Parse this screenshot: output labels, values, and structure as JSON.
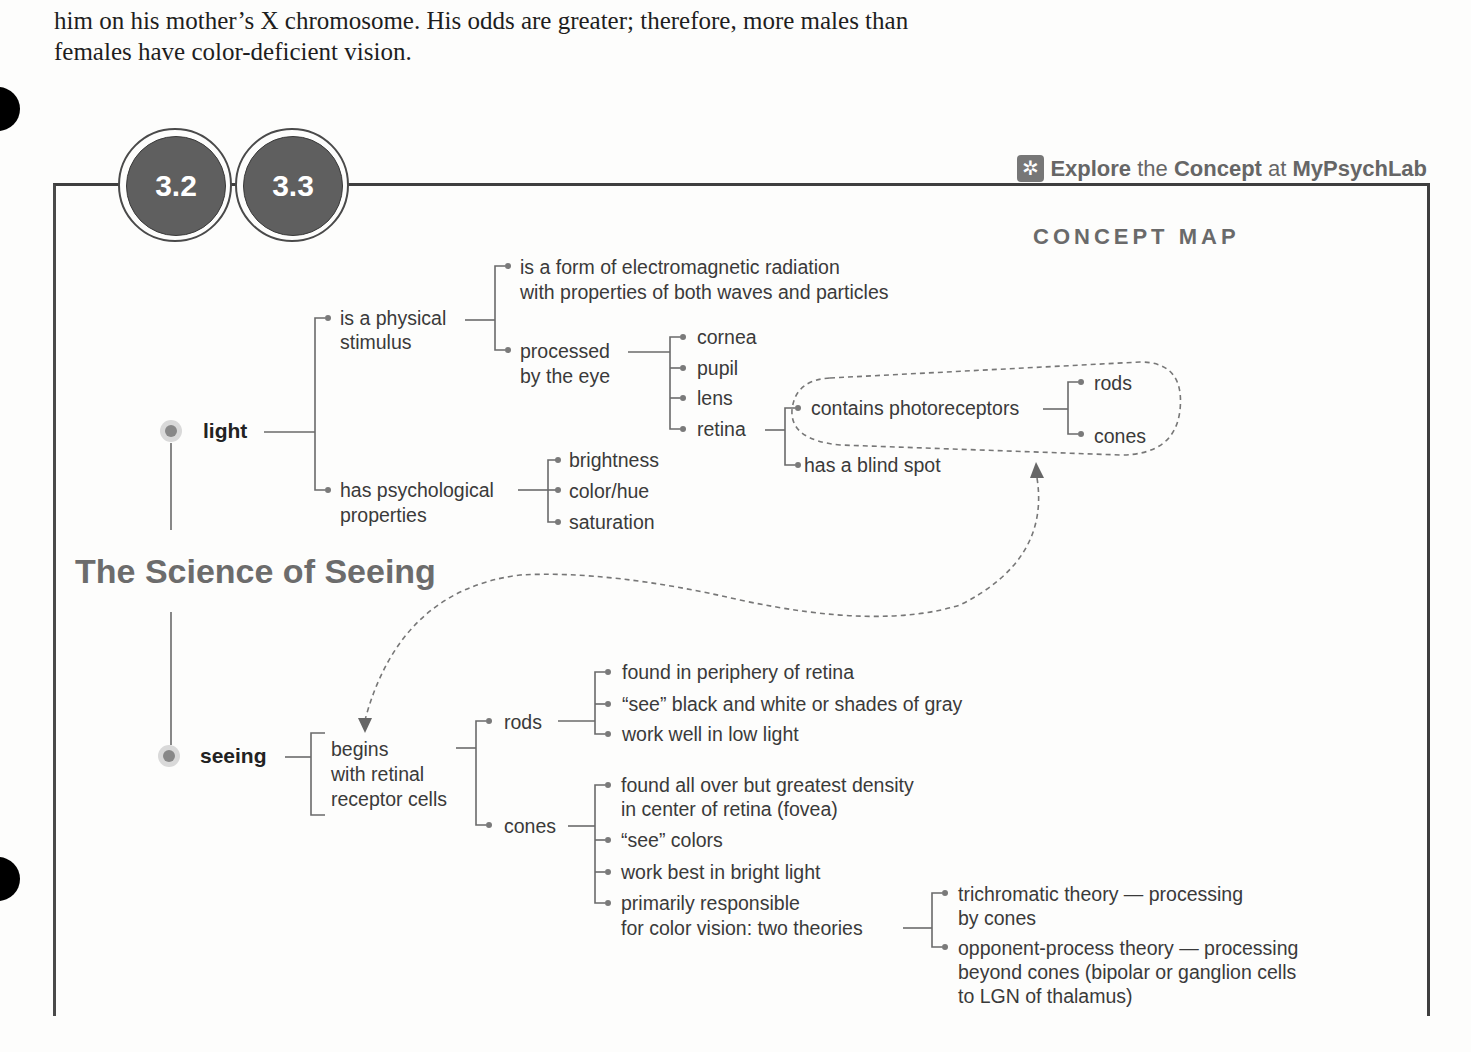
{
  "body_text": {
    "line1": "him on his mother’s X chromosome. His odds are greater; therefore, more males than",
    "line2": "females have color-deficient vision."
  },
  "section_badges": [
    "3.2",
    "3.3"
  ],
  "explore_link": {
    "icon": "explore-icon",
    "part1": "Explore",
    "part2": " the ",
    "part3": "Concept",
    "part4": " at ",
    "part5": "MyPsychLab"
  },
  "concept_map_label": "CONCEPT MAP",
  "title": "The Science of Seeing",
  "light": {
    "label": "light",
    "physical": {
      "label1": "is a physical",
      "label2": "stimulus",
      "em1": "is a form of electromagnetic radiation",
      "em2": "with properties of both waves and particles",
      "eye1": "processed",
      "eye2": "by the eye",
      "eye_parts": [
        "cornea",
        "pupil",
        "lens",
        "retina"
      ],
      "retina": {
        "photo": "contains photoreceptors",
        "photo_types": [
          "rods",
          "cones"
        ],
        "blind": "has a blind spot"
      }
    },
    "psych": {
      "label1": "has psychological",
      "label2": "properties",
      "items": [
        "brightness",
        "color/hue",
        "saturation"
      ]
    }
  },
  "seeing": {
    "label": "seeing",
    "begins1": "begins",
    "begins2": "with retinal",
    "begins3": "receptor cells",
    "rods": {
      "label": "rods",
      "items": [
        "found in periphery of retina",
        "“see” black and white or shades of gray",
        "work well in low light"
      ]
    },
    "cones": {
      "label": "cones",
      "item1a": "found all over but greatest density",
      "item1b": "in center of retina (fovea)",
      "item2": "“see” colors",
      "item3": "work best in bright light",
      "item4a": "primarily responsible",
      "item4b": "for color vision: two theories",
      "theories": {
        "tri1": "trichromatic theory — processing",
        "tri2": "by cones",
        "opp1": "opponent-process theory — processing",
        "opp2": "beyond cones (bipolar or ganglion cells",
        "opp3": "to LGN of thalamus)"
      }
    }
  }
}
